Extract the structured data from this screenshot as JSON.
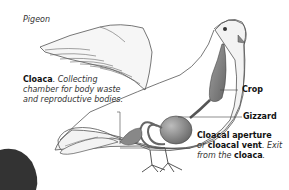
{
  "title": "Pigeon",
  "labels": {
    "cloaca": {
      "term": "Cloaca",
      "description_line1": ". Collecting",
      "description_line2": "chamber for body waste",
      "description_line3": "and reproductive bodies."
    },
    "crop": "Crop",
    "gizzard": "Gizzard",
    "cloacal_aperture": {
      "term1": "Cloacal aperture",
      "or": "or ",
      "term2": "cloacal vent",
      "desc": ". Exit",
      "line3_prefix": "from the ",
      "term3": "cloaca",
      "line3_suffix": "."
    }
  },
  "colors": {
    "body_fill": "#f3f3f3",
    "outline": "#555555",
    "organ_fill": "#7a7a7a",
    "organ_highlight": "#b5b5b5",
    "leader_line": "#444444"
  }
}
